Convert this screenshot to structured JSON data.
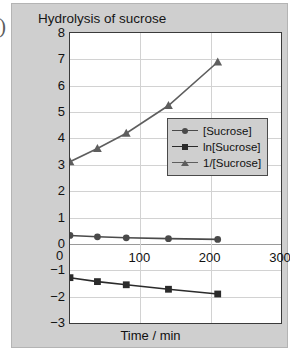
{
  "edge_glyph": ")",
  "chart_data": {
    "type": "line",
    "title": "Hydrolysis of sucrose",
    "xlabel": "Time / min",
    "ylabel": "",
    "xlim": [
      0,
      300
    ],
    "ylim": [
      -3,
      8
    ],
    "xticks": [
      0,
      100,
      200,
      300
    ],
    "xtick_labels": [
      "0",
      "100",
      "200",
      "300"
    ],
    "yticks": [
      8,
      7,
      6,
      5,
      4,
      3,
      2,
      1,
      0,
      -1,
      -2,
      -3
    ],
    "ytick_labels": [
      "8",
      "7",
      "6",
      "5",
      "4",
      "3",
      "2",
      "1",
      "0",
      "−1",
      "−2",
      "−3"
    ],
    "grid": true,
    "legend_position": "center-right",
    "series": [
      {
        "name": "[Sucrose]",
        "marker": "circle",
        "color": "#4a4a4a",
        "x": [
          0,
          39,
          80,
          140,
          210
        ],
        "values": [
          0.32,
          0.27,
          0.23,
          0.2,
          0.17
        ]
      },
      {
        "name": "ln[Sucrose]",
        "marker": "square",
        "color": "#2b2b2b",
        "x": [
          0,
          39,
          80,
          140,
          210
        ],
        "values": [
          -1.28,
          -1.43,
          -1.55,
          -1.72,
          -1.9
        ]
      },
      {
        "name": "1/[Sucrose]",
        "marker": "triangle",
        "color": "#5e5e5e",
        "x": [
          0,
          39,
          80,
          140,
          210
        ],
        "values": [
          3.12,
          3.62,
          4.2,
          5.25,
          6.9
        ]
      }
    ]
  },
  "legend": {
    "entries": [
      {
        "label": "[Sucrose]"
      },
      {
        "label": "ln[Sucrose]"
      },
      {
        "label": "1/[Sucrose]"
      }
    ]
  },
  "xzero_label": "0"
}
